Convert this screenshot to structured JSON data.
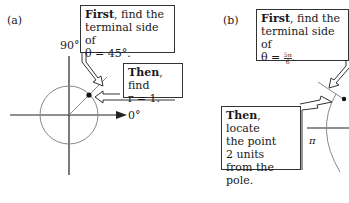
{
  "panels": [
    {
      "label": "(a)",
      "axis_labels": {
        "top": "90°",
        "right": "0°"
      },
      "callouts": [
        {
          "bold": "First",
          "text_line1": ", find the",
          "text_line2": "terminal side of",
          "text_line3": "θ = 45°."
        },
        {
          "bold": "Then",
          "text_line1": ", find",
          "text_line2": "r = 1."
        }
      ],
      "angle_deg": 45,
      "radius": 1
    },
    {
      "label": "(b)",
      "axis_labels": {
        "left": "π"
      },
      "callouts": [
        {
          "bold": "First",
          "text_line1": ", find the",
          "text_line2": "terminal side of",
          "text_line3_prefix": "θ = ",
          "frac_num": "5π",
          "frac_den": "6",
          "text_line3_suffix": "."
        },
        {
          "bold": "Then",
          "text_line1": ", locate",
          "text_line2": "the point",
          "text_line3": "2 units",
          "text_line4": "from the pole."
        }
      ],
      "angle_expr": "5π/6",
      "radius": 2
    }
  ]
}
